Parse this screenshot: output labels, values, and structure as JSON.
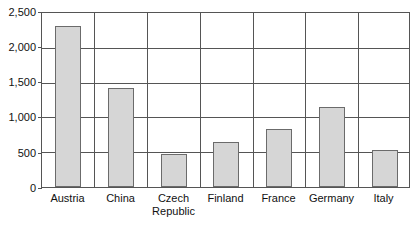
{
  "chart_data": {
    "type": "bar",
    "title": "",
    "subtitle": "",
    "xlabel": "",
    "ylabel": "",
    "categories": [
      "Austria",
      "China",
      "Czech\nRepublic",
      "Finland",
      "France",
      "Germany",
      "Italy"
    ],
    "values": [
      2320,
      1420,
      470,
      640,
      840,
      1150,
      525
    ],
    "ylim": [
      0,
      2500
    ],
    "ytick_labels": [
      "2,500",
      "2,000",
      "1,500",
      "1,000",
      "500",
      "0"
    ],
    "ytick_values": [
      2500,
      2000,
      1500,
      1000,
      500,
      0
    ],
    "grid": true,
    "legend": null,
    "annotations": [],
    "bar_fill": "#d6d6d6",
    "bar_border": "#6b6b6b",
    "axis_color": "#555555",
    "background": "#ffffff"
  },
  "axis": {
    "y_labels": {
      "t0": "2,500",
      "t1": "2,000",
      "t2": "1,500",
      "t3": "1,000",
      "t4": "500",
      "t5": "0"
    },
    "x_labels": {
      "c0": "Austria",
      "c1": "China",
      "c2": "Czech\nRepublic",
      "c3": "Finland",
      "c4": "France",
      "c5": "Germany",
      "c6": "Italy"
    }
  }
}
